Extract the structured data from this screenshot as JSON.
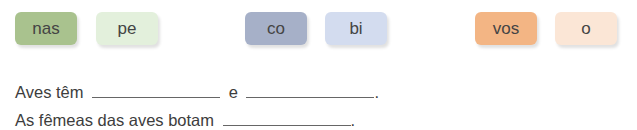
{
  "syllable_tiles": [
    {
      "text": "nas",
      "color": "#a9c28e",
      "group": 1
    },
    {
      "text": "pe",
      "color": "#e3f0dc",
      "group": 1
    },
    {
      "text": "co",
      "color": "#a6b0c8",
      "group": 2
    },
    {
      "text": "bi",
      "color": "#d3dcef",
      "group": 2
    },
    {
      "text": "vos",
      "color": "#f3b584",
      "group": 3
    },
    {
      "text": "o",
      "color": "#fbe6d6",
      "group": 3
    }
  ],
  "sentences": [
    {
      "part1": "Aves têm",
      "part2": "e",
      "end": "."
    },
    {
      "part1": "As fêmeas das aves botam",
      "end": "."
    }
  ]
}
